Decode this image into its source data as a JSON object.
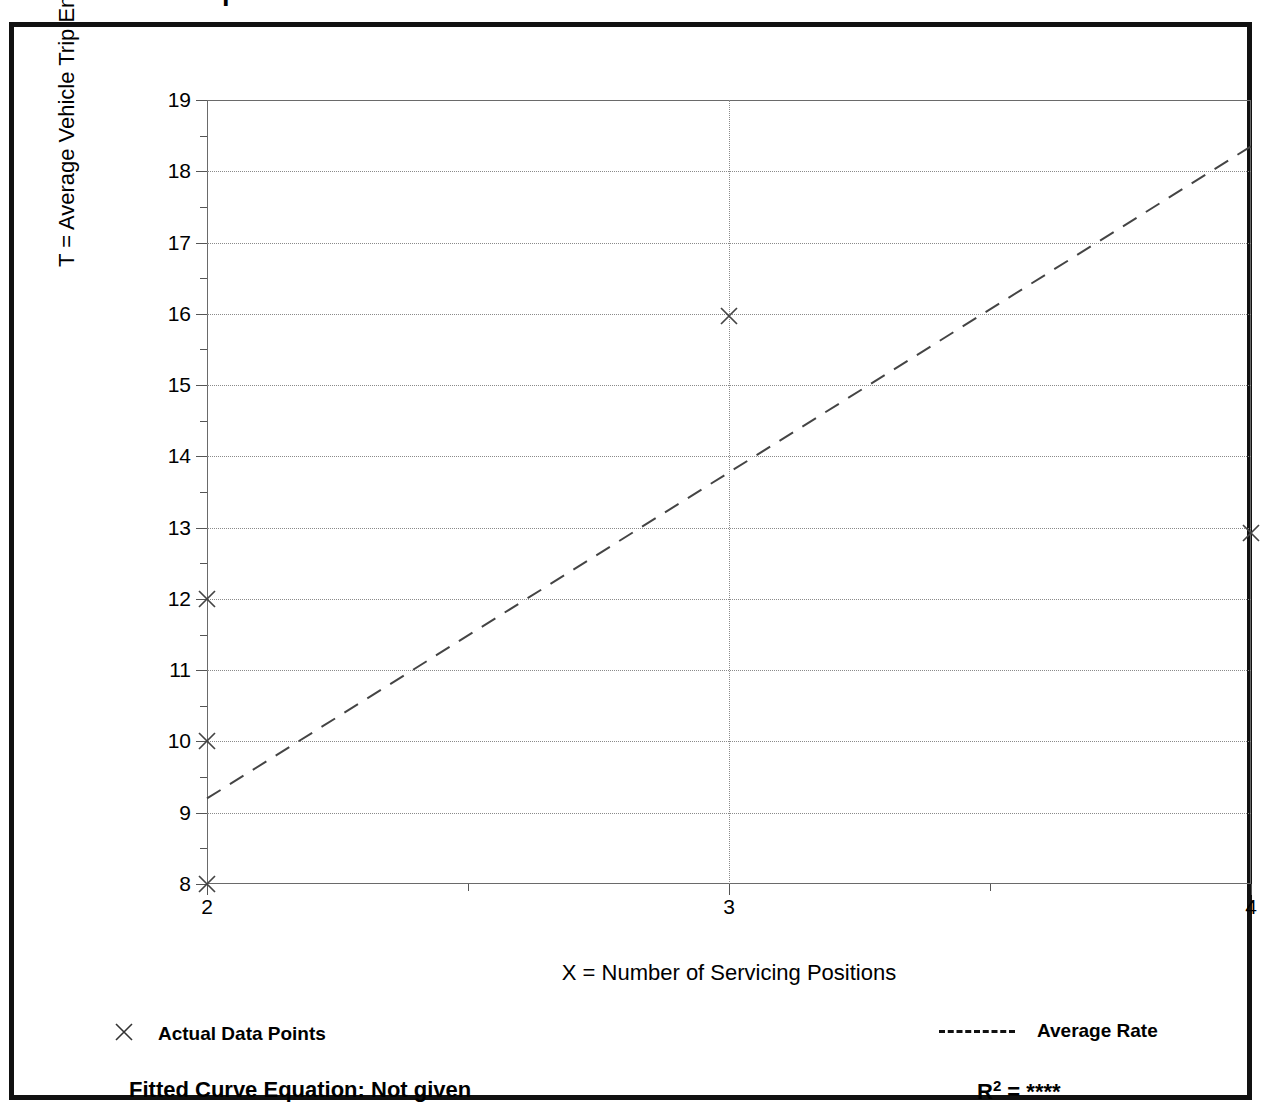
{
  "title": "Data Plot and Equation",
  "chart_data": {
    "type": "scatter",
    "title": "Data Plot and Equation",
    "xlabel": "X = Number of Servicing Positions",
    "ylabel": "T = Average Vehicle Trip Ends",
    "xlim": [
      2,
      4
    ],
    "ylim": [
      8,
      19
    ],
    "grid": true,
    "x_ticks": [
      2,
      3,
      4
    ],
    "x_tick_labels": [
      "2",
      "3",
      "4"
    ],
    "x_minor_ticks": [
      2.5,
      3.5
    ],
    "y_ticks": [
      8,
      9,
      10,
      11,
      12,
      13,
      14,
      15,
      16,
      17,
      18,
      19
    ],
    "y_tick_labels": [
      "8",
      "9",
      "10",
      "11",
      "12",
      "13",
      "14",
      "15",
      "16",
      "17",
      "18",
      "19"
    ],
    "y_minor_ticks": [
      8.5,
      9.5,
      10.5,
      11.5,
      12.5,
      13.5,
      14.5,
      15.5,
      16.5,
      17.5,
      18.5
    ],
    "vertical_gridlines": [
      3
    ],
    "series": [
      {
        "name": "Actual Data Points",
        "type": "scatter",
        "marker": "x",
        "points": [
          {
            "x": 2,
            "y": 8.0
          },
          {
            "x": 2,
            "y": 10.0
          },
          {
            "x": 2,
            "y": 12.0
          },
          {
            "x": 3,
            "y": 15.97
          },
          {
            "x": 4,
            "y": 12.93
          }
        ]
      },
      {
        "name": "Average Rate",
        "type": "line",
        "style": "dashed",
        "points": [
          {
            "x": 2,
            "y": 9.2
          },
          {
            "x": 4,
            "y": 18.35
          }
        ]
      }
    ],
    "legend_position": "below-axes",
    "legend": [
      {
        "label": "Actual Data Points",
        "marker": "x"
      },
      {
        "label": "Average Rate",
        "marker": "dashed-line"
      }
    ],
    "annotations": {
      "fitted_curve_equation_label": "Fitted Curve Equation:",
      "fitted_curve_equation_value": "Not given",
      "r_squared_label": "R",
      "r_squared_exponent": "2",
      "r_squared_equals": "=",
      "r_squared_value": "****"
    }
  },
  "footer": {
    "fitted_equation": "Fitted Curve Equation:  Not given",
    "r_squared_text": "R2 = ****"
  },
  "colors": {
    "frame": "#111111",
    "axis": "#6a6a6a",
    "grid": "#8a8a8a",
    "data": "#444444",
    "text": "#000000"
  }
}
